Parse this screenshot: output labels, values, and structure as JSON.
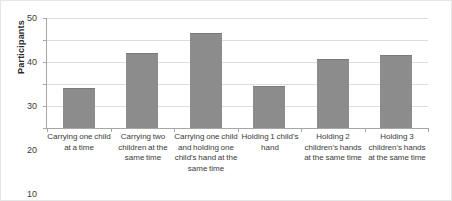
{
  "chart_data": {
    "type": "bar",
    "title": "",
    "xlabel": "",
    "ylabel": "Participants",
    "ylim": [
      0,
      50
    ],
    "yticks": [
      0,
      10,
      20,
      30,
      40,
      50
    ],
    "ytick_labels": [
      "0",
      "10",
      "20",
      "30",
      "40",
      "50"
    ],
    "grid": true,
    "legend": "none",
    "bar_color": "#8c8c8c",
    "gridline_color": "#dcdcdc",
    "axis_color": "#a6a6a6",
    "categories": [
      "Carrying one child at a time",
      "Carrying two children at the same time",
      "Carrying one child and holding one child's hand at the same time",
      "Holding 1 child's hand",
      "Holding 2 children's hands at the same time",
      "Holding 3 children's hands at the same time"
    ],
    "values": [
      18,
      34,
      43,
      19,
      31.5,
      33
    ]
  }
}
